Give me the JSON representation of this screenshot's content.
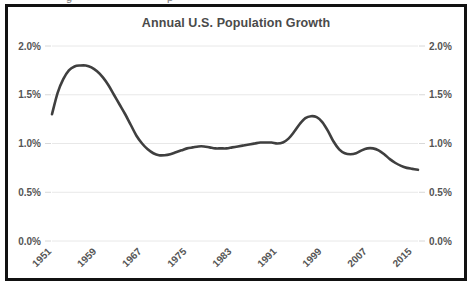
{
  "clipped_above": [
    {
      "text": "g",
      "left": 66
    },
    {
      "text": "p",
      "left": 167
    }
  ],
  "chart_data": {
    "type": "line",
    "title": "Annual U.S. Population Growth",
    "xlabel": "",
    "ylabel": "",
    "ylim": [
      0.0,
      2.0
    ],
    "xlim": [
      1951,
      2016
    ],
    "grid": true,
    "legend": false,
    "legend_position": "none",
    "line_color": "#3f3f3f",
    "gridline_color": "#e8e8e8",
    "tick_label_color": "#555555",
    "title_color": "#4a4a4a",
    "border_color": "#111111",
    "y_tick_labels": [
      "2.0%",
      "1.5%",
      "1.0%",
      "0.5%",
      "0.0%"
    ],
    "y_tick_values": [
      2.0,
      1.5,
      1.0,
      0.5,
      0.0
    ],
    "y_axis_right_mirrored": true,
    "x_tick_labels": [
      "1951",
      "1959",
      "1967",
      "1975",
      "1983",
      "1991",
      "1999",
      "2007",
      "2015"
    ],
    "x_tick_values": [
      1951,
      1959,
      1967,
      1975,
      1983,
      1991,
      1999,
      2007,
      2015
    ],
    "x_tick_rotation": 45,
    "units": "percent",
    "series": [
      {
        "name": "Annual U.S. Population Growth",
        "x": [
          1951,
          1952,
          1953,
          1954,
          1955,
          1956,
          1957,
          1958,
          1959,
          1960,
          1961,
          1962,
          1963,
          1964,
          1965,
          1966,
          1967,
          1968,
          1969,
          1970,
          1971,
          1972,
          1973,
          1974,
          1975,
          1976,
          1977,
          1978,
          1979,
          1980,
          1981,
          1982,
          1983,
          1984,
          1985,
          1986,
          1987,
          1988,
          1989,
          1990,
          1991,
          1992,
          1993,
          1994,
          1995,
          1996,
          1997,
          1998,
          1999,
          2000,
          2001,
          2002,
          2003,
          2004,
          2005,
          2006,
          2007,
          2008,
          2009,
          2010,
          2011,
          2012,
          2013,
          2014,
          2015,
          2016
        ],
        "values": [
          1.3,
          1.52,
          1.66,
          1.75,
          1.79,
          1.8,
          1.8,
          1.78,
          1.74,
          1.68,
          1.6,
          1.5,
          1.4,
          1.3,
          1.19,
          1.08,
          1.0,
          0.94,
          0.9,
          0.88,
          0.88,
          0.89,
          0.91,
          0.93,
          0.95,
          0.96,
          0.97,
          0.97,
          0.96,
          0.95,
          0.95,
          0.95,
          0.96,
          0.97,
          0.98,
          0.99,
          1.0,
          1.01,
          1.01,
          1.01,
          1.0,
          1.01,
          1.05,
          1.12,
          1.2,
          1.26,
          1.28,
          1.27,
          1.22,
          1.13,
          1.02,
          0.94,
          0.9,
          0.89,
          0.9,
          0.93,
          0.95,
          0.95,
          0.93,
          0.89,
          0.84,
          0.8,
          0.77,
          0.75,
          0.74,
          0.73
        ]
      }
    ]
  }
}
